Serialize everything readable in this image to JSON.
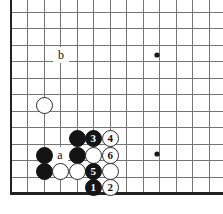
{
  "diagram": {
    "kind": "go-board-diagram",
    "board": {
      "background_color": "#ffffff",
      "line_color": "#767676",
      "edge_line_color": "#222222",
      "origin_x": 11,
      "origin_y": 12,
      "cell_size": 16.5,
      "cols": 13,
      "rows": 12,
      "edges": {
        "left": true,
        "bottom": true,
        "top": false,
        "right": false
      }
    },
    "star_points": [
      {
        "name": "star-point-upper-right",
        "col": 9,
        "row": 2.6,
        "x": 157,
        "y": 55
      },
      {
        "name": "star-point-lower-right",
        "col": 9,
        "row": 8.6,
        "x": 157,
        "y": 154
      }
    ],
    "stones": [
      {
        "name": "white-stone-upper-left",
        "color": "white",
        "label": "",
        "x": 44,
        "y": 105
      },
      {
        "name": "black-stone-d8",
        "color": "black",
        "label": "",
        "x": 77,
        "y": 138
      },
      {
        "name": "black-stone-move-3",
        "color": "black",
        "label": "3",
        "x": 93,
        "y": 138
      },
      {
        "name": "white-stone-move-4",
        "color": "white",
        "label": "4",
        "x": 110,
        "y": 138
      },
      {
        "name": "black-stone-b9",
        "color": "black",
        "label": "",
        "x": 44,
        "y": 155
      },
      {
        "name": "black-stone-d9",
        "color": "black",
        "label": "",
        "x": 77,
        "y": 155
      },
      {
        "name": "white-stone-e9",
        "color": "white",
        "label": "",
        "x": 93,
        "y": 155
      },
      {
        "name": "white-stone-move-6",
        "color": "white",
        "label": "6",
        "x": 110,
        "y": 155
      },
      {
        "name": "black-stone-b10",
        "color": "black",
        "label": "",
        "x": 44,
        "y": 171
      },
      {
        "name": "white-stone-c10",
        "color": "white",
        "label": "",
        "x": 60,
        "y": 171
      },
      {
        "name": "white-stone-d10",
        "color": "white",
        "label": "",
        "x": 77,
        "y": 171
      },
      {
        "name": "black-stone-move-5",
        "color": "black",
        "label": "5",
        "x": 93,
        "y": 171
      },
      {
        "name": "white-stone-f10",
        "color": "white",
        "label": "",
        "x": 110,
        "y": 171
      },
      {
        "name": "black-stone-move-1",
        "color": "black",
        "label": "1",
        "x": 93,
        "y": 187
      },
      {
        "name": "white-stone-move-2",
        "color": "white",
        "label": "2",
        "x": 110,
        "y": 187
      }
    ],
    "point_labels": [
      {
        "name": "point-label-b",
        "text": "b",
        "x": 61,
        "y": 55
      },
      {
        "name": "point-label-a",
        "text": "a",
        "x": 60,
        "y": 155
      }
    ]
  }
}
